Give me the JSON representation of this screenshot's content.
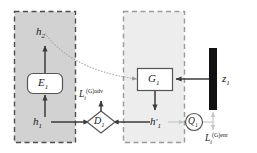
{
  "diagram": {
    "panels": [
      {
        "name": "encoder-panel",
        "fill": "#d2d2d2",
        "stroke": "#4d4d4d"
      },
      {
        "name": "generator-panel",
        "fill": "#ededed",
        "stroke": "#9a9a9a"
      }
    ],
    "nodes": {
      "h2": {
        "label": "h",
        "sub": "2"
      },
      "E1": {
        "label": "E",
        "sub": "1"
      },
      "h1": {
        "label": "h",
        "sub": "1"
      },
      "G1": {
        "label": "G",
        "sub": "1"
      },
      "h1_prime": {
        "label": "h",
        "sub": "1",
        "prime": "′"
      },
      "z1": {
        "label": "z",
        "sub": "1"
      },
      "D1": {
        "label": "D",
        "sub": "1"
      },
      "Q1": {
        "label": "Q",
        "sub": "1"
      }
    },
    "losses": {
      "adv": {
        "base": "L",
        "sub": "i",
        "sup": "(G)adv"
      },
      "ent": {
        "base": "L",
        "sub": "i",
        "sup": "(G)ent"
      }
    },
    "colors": {
      "line": "#4d4d4d",
      "faint_line": "#c4c4c4",
      "z_block": "#111111",
      "box_fill": "#ffffff",
      "text": "#1a1a1a"
    }
  }
}
